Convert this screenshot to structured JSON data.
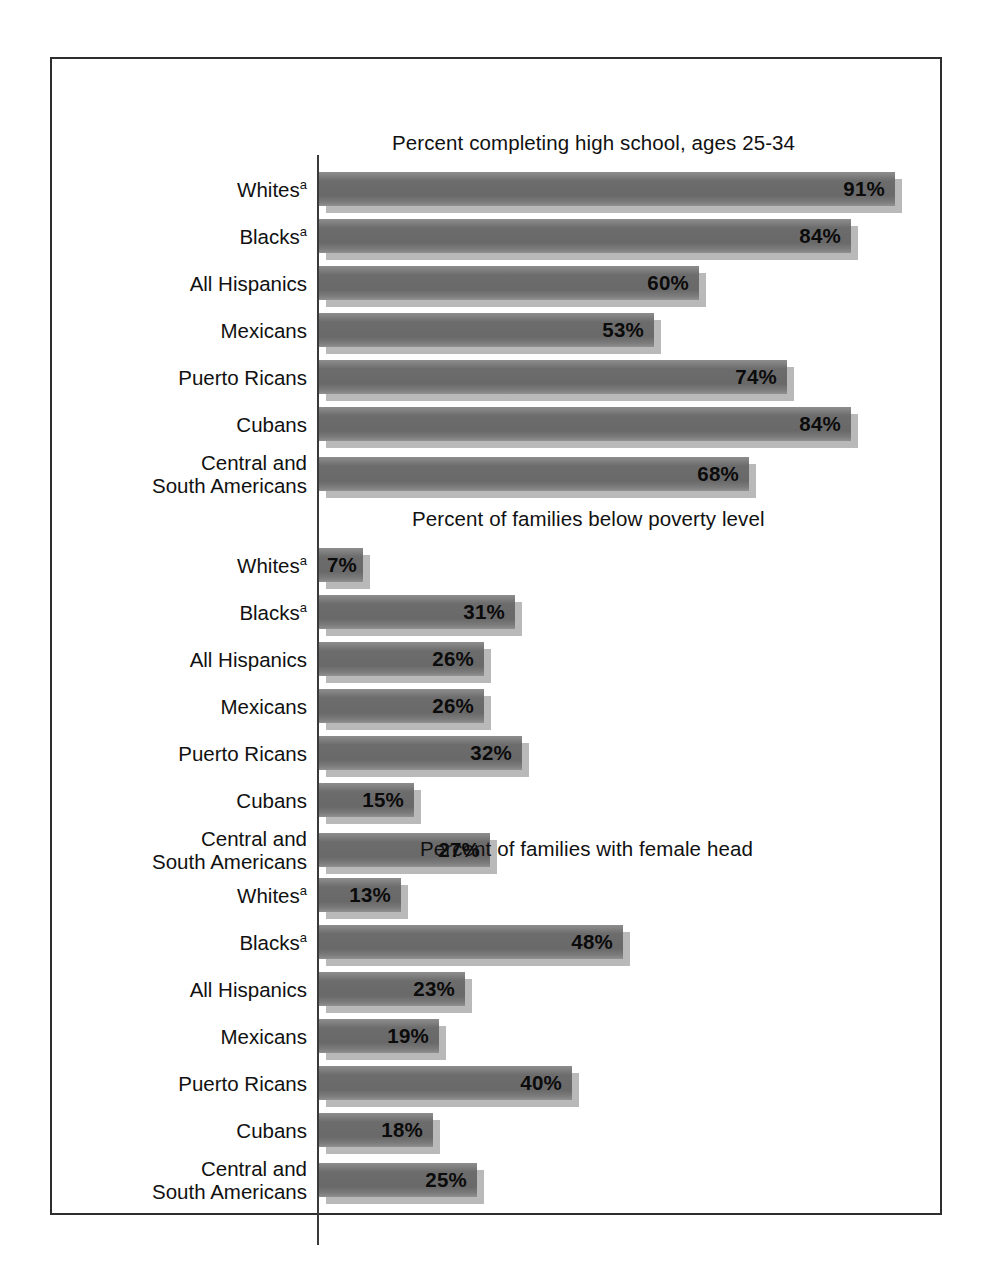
{
  "figure": {
    "background_color": "#ffffff",
    "frame_color": "#2e2e2e",
    "bar_color": "#6f6e6f",
    "bar_shadow_color": "#b9b9b9",
    "axis_color": "#3a3a3a",
    "text_color": "#111111"
  },
  "chart_data": {
    "type": "bar",
    "orientation": "horizontal",
    "title": "",
    "xlabel": "",
    "ylabel": "",
    "xlim": [
      0,
      100
    ],
    "grid": false,
    "legend": "none",
    "value_suffix": "%",
    "px_per_percent": 6.33,
    "categories": [
      "Whites",
      "Blacks",
      "All Hispanics",
      "Mexicans",
      "Puerto Ricans",
      "Cubans",
      "Central and South Americans"
    ],
    "category_footnote_marks": [
      "a",
      "a",
      "",
      "",
      "",
      "",
      ""
    ],
    "panels": [
      {
        "title": "Percent completing high school, ages 25-34",
        "values": [
          91,
          84,
          60,
          53,
          74,
          84,
          68
        ],
        "labels": [
          "91%",
          "84%",
          "60%",
          "53%",
          "74%",
          "84%",
          "68%"
        ]
      },
      {
        "title": "Percent of families below poverty level",
        "values": [
          7,
          31,
          26,
          26,
          32,
          15,
          27
        ],
        "labels": [
          "7%",
          "31%",
          "26%",
          "26%",
          "32%",
          "15%",
          "27%"
        ]
      },
      {
        "title": "Percent of families with female head",
        "values": [
          13,
          48,
          23,
          19,
          40,
          18,
          25
        ],
        "labels": [
          "13%",
          "48%",
          "23%",
          "19%",
          "40%",
          "18%",
          "25%"
        ]
      }
    ]
  },
  "category_lines": [
    {
      "line1": "Whites",
      "sup": "a",
      "line2": ""
    },
    {
      "line1": "Blacks",
      "sup": "a",
      "line2": ""
    },
    {
      "line1": "All Hispanics",
      "sup": "",
      "line2": ""
    },
    {
      "line1": "Mexicans",
      "sup": "",
      "line2": ""
    },
    {
      "line1": "Puerto Ricans",
      "sup": "",
      "line2": ""
    },
    {
      "line1": "Cubans",
      "sup": "",
      "line2": ""
    },
    {
      "line1": "Central and",
      "sup": "",
      "line2": "South Americans"
    }
  ]
}
